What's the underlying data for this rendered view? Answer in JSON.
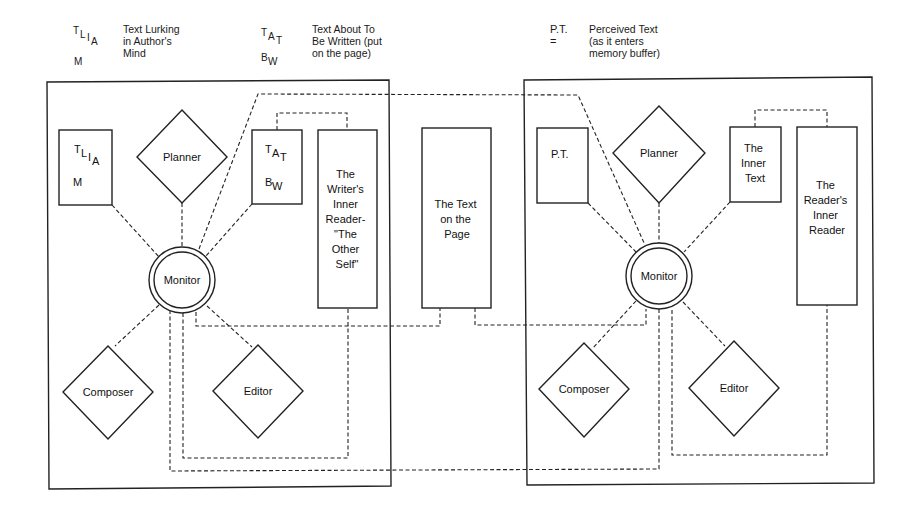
{
  "legend": {
    "tlia": {
      "symbol_main": "T",
      "symbol_l": "L",
      "symbol_i": "I",
      "symbol_a": "A",
      "symbol_m": "M",
      "description": "Text Lurking\nin Author's\nMind"
    },
    "tatbw": {
      "symbol_t": "T",
      "symbol_a": "A",
      "symbol_t2": "T",
      "symbol_b": "B",
      "symbol_w": "W",
      "description": "Text About To\nBe Written (put\non the page)"
    },
    "pt": {
      "symbol": "P.T. =",
      "description": "Perceived Text\n(as it enters\nmemory buffer)"
    }
  },
  "writer_panel": {
    "tlia_box": {
      "t": "T",
      "l": "L",
      "i": "I",
      "a": "A",
      "m": "M"
    },
    "planner": "Planner",
    "tatbw_box": {
      "t": "T",
      "a": "A",
      "t2": "T",
      "b": "B",
      "w": "W"
    },
    "inner_reader": [
      "The",
      "Writer's",
      "Inner",
      "Reader-",
      "\"The",
      "Other",
      "Self\""
    ],
    "monitor": "Monitor",
    "composer": "Composer",
    "editor": "Editor"
  },
  "center": {
    "text_on_page": [
      "The Text",
      "on the",
      "Page"
    ]
  },
  "reader_panel": {
    "pt_box": "P.T.",
    "planner": "Planner",
    "inner_text": [
      "The",
      "Inner",
      "Text"
    ],
    "inner_reader": [
      "The",
      "Reader's",
      "Inner",
      "Reader"
    ],
    "monitor": "Monitor",
    "composer": "Composer",
    "editor": "Editor"
  }
}
